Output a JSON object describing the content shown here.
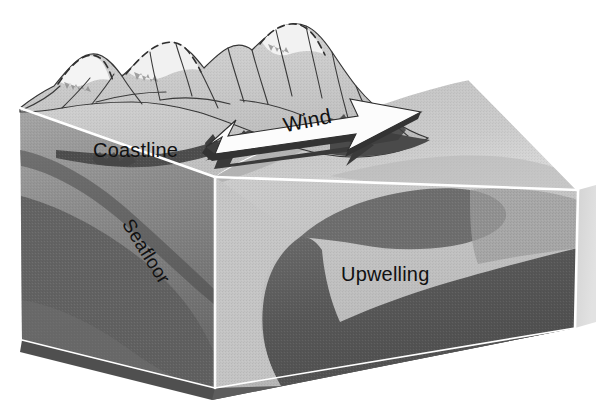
{
  "figure": {
    "type": "schematic-block-diagram",
    "background_color": "#ffffff"
  },
  "labels": {
    "coastline": "Coastline",
    "wind": "Wind",
    "seafloor": "Seafloor",
    "upwelling": "Upwelling"
  },
  "icons": {
    "wind_arrow": "wind-arrow-icon",
    "mountain_range": "mountain-range-icon",
    "upwelling_plume": "upwelling-plume-icon"
  },
  "colors": {
    "paper": "#ffffff",
    "mountain_light": "#c9c9c9",
    "mountain_snow": "#f2f2f2",
    "mountain_outline": "#2b2b2b",
    "land_top": "#cfcfcf",
    "ocean_surface": "#c4c4c4",
    "ocean_surface_right": "#dcdcdc",
    "left_face_upper": "#9a9a9a",
    "left_face_lower": "#6d6d6d",
    "front_face": "#c2c2c2",
    "right_face": "#d8d8d8",
    "upwelling_dark": "#565656",
    "upwelling_mid": "#7b7b7b",
    "base_slab": "#5a5a5a",
    "edge_highlight": "#ffffff",
    "arrow_fill": "#fbfbfb",
    "arrow_shadow": "#3a3a3a",
    "label_text": "#111111"
  },
  "structure": {
    "block_description": "Isometric cutaway block showing coastline, ocean surface, seafloor and an upwelling plume",
    "faces": [
      "top-land",
      "top-ocean",
      "left-cross-section",
      "front-cross-section",
      "right-cross-section",
      "base-slab"
    ]
  }
}
